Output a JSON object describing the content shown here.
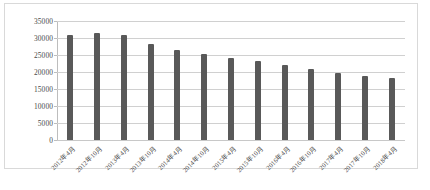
{
  "chart_data": {
    "type": "bar",
    "title": "",
    "xlabel": "",
    "ylabel": "",
    "ylim": [
      0,
      35000
    ],
    "ytick_step": 5000,
    "yticks": [
      "35000",
      "30000",
      "25000",
      "20000",
      "15000",
      "10000",
      "5000",
      "0"
    ],
    "grid": true,
    "legend": false,
    "bar_color": "#595959",
    "gridline_color": "#d0d0d0",
    "categories": [
      "2012年4月",
      "2012年10月",
      "2013年4月",
      "2013年10月",
      "2014年4月",
      "2014年10月",
      "2015年4月",
      "2015年10月",
      "2016年4月",
      "2016年10月",
      "2017年4月",
      "2017年10月",
      "2018年4月"
    ],
    "values": [
      31000,
      31500,
      30900,
      28200,
      26600,
      25400,
      24100,
      23200,
      22000,
      21000,
      19800,
      18700,
      18300
    ]
  },
  "caption": {
    "text": ""
  }
}
